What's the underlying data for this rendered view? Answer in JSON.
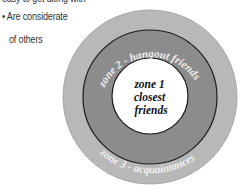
{
  "bullets": {
    "cut_line": "easy to get along with",
    "items": [
      {
        "marker": "•",
        "line1": "Are considerate",
        "line2": "of others"
      }
    ]
  },
  "diagram": {
    "zones": [
      {
        "id": "zone1",
        "label_lines": [
          "zone 1",
          "closest",
          "friends"
        ],
        "fill": "#ffffff"
      },
      {
        "id": "zone2",
        "label": "zone 2 - hangout friends",
        "fill": "#8c8c8c"
      },
      {
        "id": "zone3",
        "label": "zone 3 - acquaintances",
        "fill": "#b8b8b8"
      }
    ],
    "stroke": "#222222"
  }
}
